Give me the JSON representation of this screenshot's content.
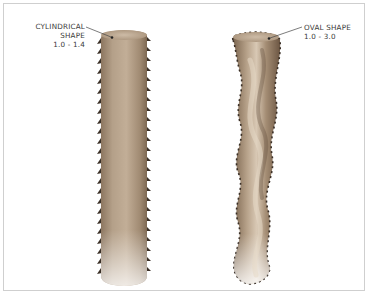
{
  "diagram": {
    "shapes": [
      {
        "id": "cylindrical",
        "name": "CYLINDRICAL SHAPE",
        "ratio": "1.0 - 1.4"
      },
      {
        "id": "oval",
        "name": "OVAL SHAPE",
        "ratio": "1.0 - 3.0"
      }
    ],
    "colors": {
      "hair_light": "#c8b6a0",
      "hair_mid": "#a38c72",
      "hair_dark": "#6e5a45",
      "cuticle": "#3a2f26",
      "frame_border": "#cfcfcf",
      "label_text": "#3a3a3a"
    }
  }
}
